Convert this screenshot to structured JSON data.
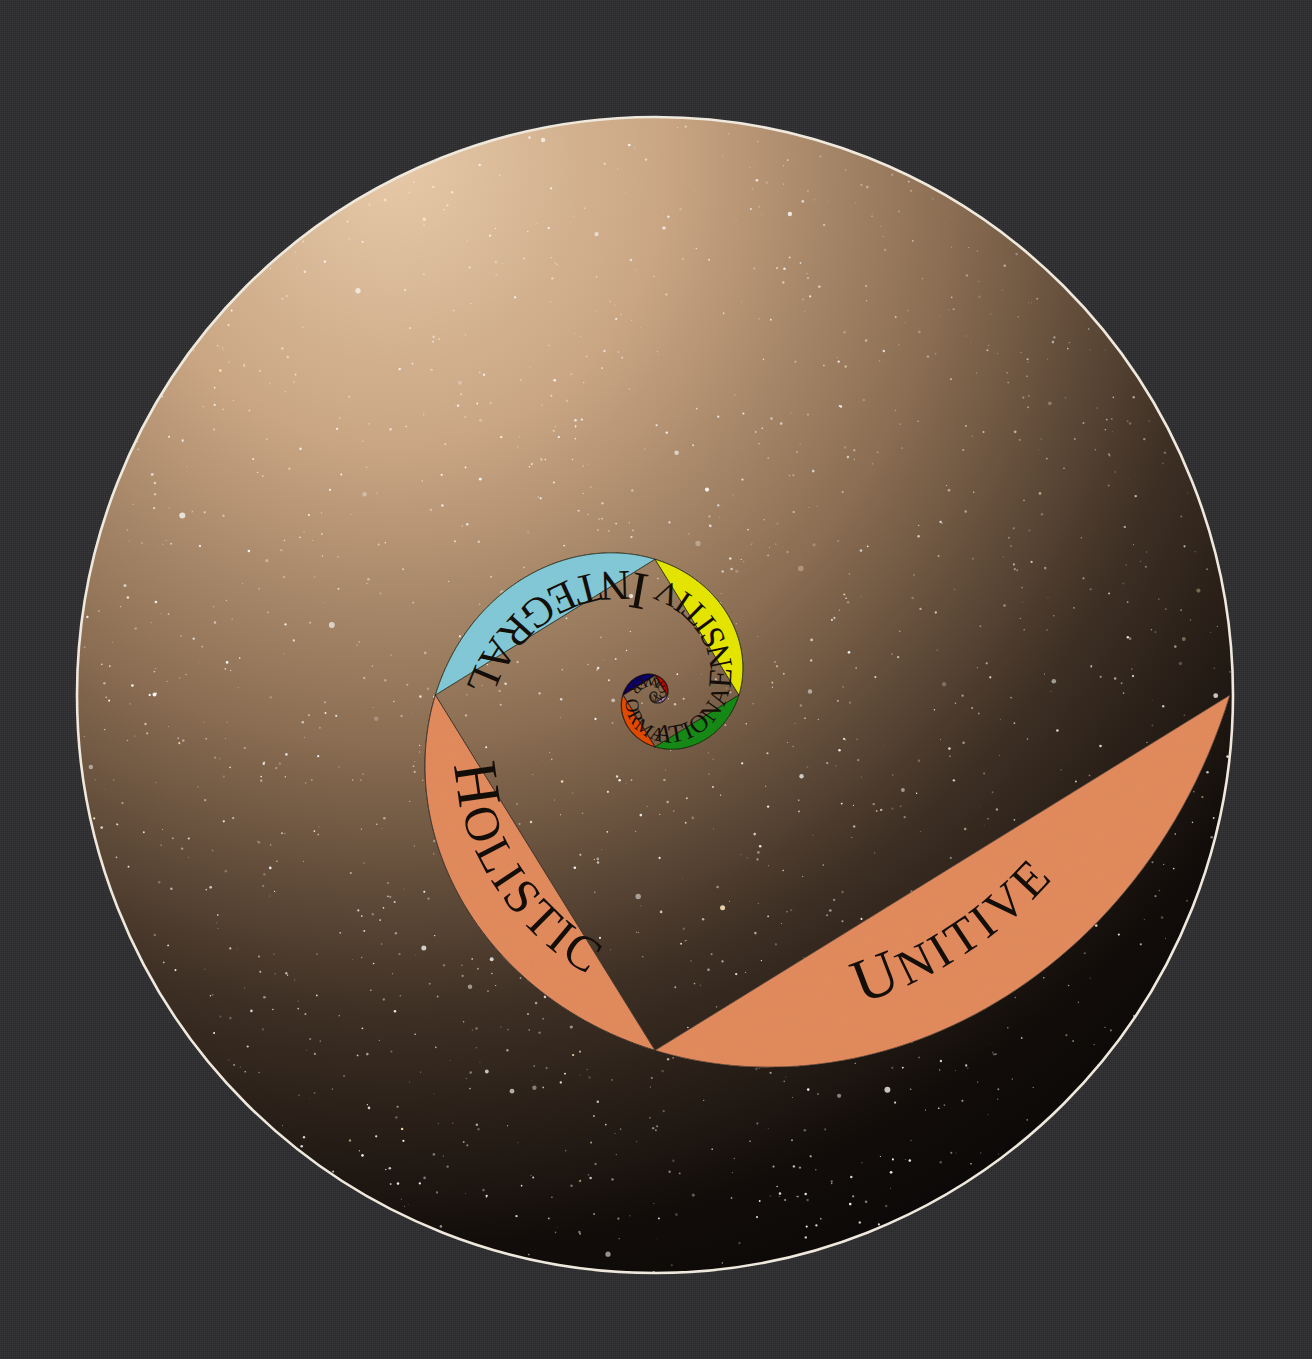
{
  "artwork": {
    "title": "Spiral of Consciousness",
    "outer_background_color": "#2c2c2e",
    "disc_border_color": "#f3efe6",
    "starfield_color": "#050507",
    "glow_color": "#c6a483"
  },
  "chart_data": {
    "type": "pie",
    "xlabel": "",
    "ylabel": "",
    "legend_position": "none",
    "grid": false,
    "categories": [
      "Instinctive",
      "Magical",
      "Powerful",
      "Conformative",
      "Rational",
      "Sensitive",
      "Integral",
      "Holistic",
      "Unitive"
    ],
    "values": [
      1,
      2,
      3,
      5,
      8,
      13,
      21,
      34,
      55
    ],
    "colors": [
      "#d9d6b2",
      "#debee0",
      "#e03a1a",
      "#3c2aa8",
      "#f08a2a",
      "#4cbb4c",
      "#f2f230",
      "#b6e2ea",
      "#f0bc9a"
    ]
  },
  "spiral": {
    "center_label": "spiral-eye",
    "segments": [
      {
        "id": "instinctive",
        "label": "Instinctive",
        "color": "#d9d6b2",
        "stage": 1
      },
      {
        "id": "magical",
        "label": "Magical",
        "color": "#debee0",
        "stage": 2
      },
      {
        "id": "powerful",
        "label": "Powerful",
        "color": "#e03a1a",
        "stage": 3
      },
      {
        "id": "conformative",
        "label": "Conformative",
        "color": "#3c2aa8",
        "stage": 4
      },
      {
        "id": "rational",
        "label": "Rational",
        "color": "#f08a2a",
        "stage": 5
      },
      {
        "id": "sensitive",
        "label": "Sensitive",
        "color": "#4cbb4c",
        "stage": 6
      },
      {
        "id": "integral",
        "label": "Integral",
        "color": "#f2f230",
        "stage": 7
      },
      {
        "id": "holistic",
        "label": "Holistic",
        "color": "#b6e2ea",
        "stage": 8
      },
      {
        "id": "unitive",
        "label": "Unitive",
        "color": "#f0bc9a",
        "stage": 9
      }
    ]
  }
}
